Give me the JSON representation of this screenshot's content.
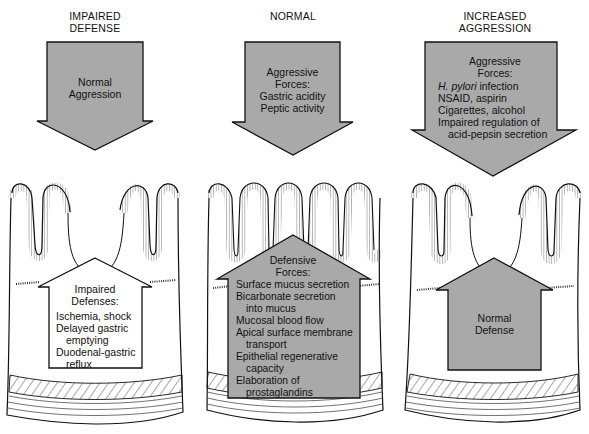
{
  "colors": {
    "arrow_fill": "#a9a9a9",
    "stroke": "#111111",
    "background": "#ffffff"
  },
  "panels": [
    {
      "title": [
        "IMPAIRED",
        "DEFENSE"
      ],
      "aggression_arrow": {
        "lines": [
          "Normal",
          "Aggression"
        ]
      },
      "defense_arrow": {
        "fill": "white",
        "heading": [
          "Impaired",
          "Defenses:"
        ],
        "items": [
          {
            "text": "Ischemia, shock"
          },
          {
            "text": "Delayed gastric",
            "cont": "emptying"
          },
          {
            "text": "Duodenal-gastric",
            "cont": "reflux"
          }
        ]
      }
    },
    {
      "title": [
        "NORMAL"
      ],
      "aggression_arrow": {
        "heading": [
          "Aggressive",
          "Forces:"
        ],
        "items": [
          "Gastric acidity",
          "Peptic activity"
        ]
      },
      "defense_arrow": {
        "fill": "gray",
        "heading": [
          "Defensive",
          "Forces:"
        ],
        "items": [
          {
            "text": "Surface mucus secretion"
          },
          {
            "text": "Bicarbonate secretion",
            "cont": "into mucus"
          },
          {
            "text": "Mucosal blood flow"
          },
          {
            "text": "Apical surface membrane",
            "cont": "transport"
          },
          {
            "text": "Epithelial regenerative",
            "cont": "capacity"
          },
          {
            "text": "Elaboration of",
            "cont": "prostaglandins"
          }
        ]
      }
    },
    {
      "title": [
        "INCREASED",
        "AGGRESSION"
      ],
      "aggression_arrow": {
        "heading": [
          "Aggressive",
          "Forces:"
        ],
        "items": [
          {
            "italic": "H. pylori",
            "text": " infection"
          },
          {
            "text": "NSAID, aspirin"
          },
          {
            "text": "Cigarettes, alcohol"
          },
          {
            "text": "Impaired regulation of",
            "cont": "acid-pepsin secretion"
          }
        ]
      },
      "defense_arrow": {
        "fill": "gray",
        "lines": [
          "Normal",
          "Defense"
        ]
      }
    }
  ]
}
